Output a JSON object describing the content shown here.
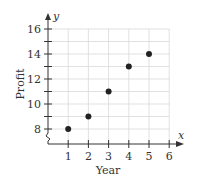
{
  "chart_data": {
    "type": "scatter",
    "title": "",
    "xlabel": "Year",
    "ylabel": "Profit",
    "x_axis_var": "x",
    "y_axis_var": "y",
    "x": [
      1,
      2,
      3,
      4,
      5
    ],
    "y": [
      8,
      9,
      11,
      13,
      14
    ],
    "xlim": [
      0,
      6
    ],
    "ylim": [
      8,
      16
    ],
    "x_ticks": [
      "1",
      "2",
      "3",
      "4",
      "5",
      "6"
    ],
    "y_ticks": [
      "8",
      "10",
      "12",
      "14",
      "16"
    ],
    "grid": true,
    "y_axis_break": true,
    "legend": null,
    "colors": {
      "points": "#222222",
      "axes": "#333333",
      "grid": "#d9d9d9"
    }
  }
}
